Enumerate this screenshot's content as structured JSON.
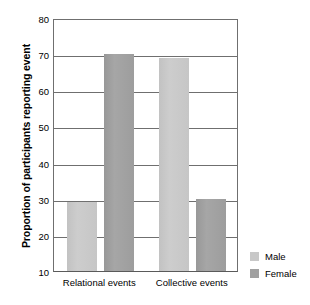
{
  "chart_data": {
    "type": "bar",
    "title": "",
    "xlabel": "",
    "ylabel": "Proportion of participants reporting event",
    "categories": [
      "Relational events",
      "Collective events"
    ],
    "series": [
      {
        "name": "Male",
        "values": [
          29,
          69
        ],
        "color": "#c8c8c8"
      },
      {
        "name": "Female",
        "values": [
          70,
          30
        ],
        "color": "#a0a0a0"
      }
    ],
    "ylim": [
      10,
      80
    ],
    "yticks": [
      10,
      20,
      30,
      40,
      50,
      60,
      70,
      80
    ],
    "ytick_labels": [
      "10",
      "20",
      "30",
      "40",
      "50",
      "60",
      "70",
      "80"
    ],
    "grid": "horizontal",
    "legend_position": "right-bottom",
    "legend": [
      {
        "label": "Male",
        "color": "#c8c8c8"
      },
      {
        "label": "Female",
        "color": "#a0a0a0"
      }
    ]
  }
}
